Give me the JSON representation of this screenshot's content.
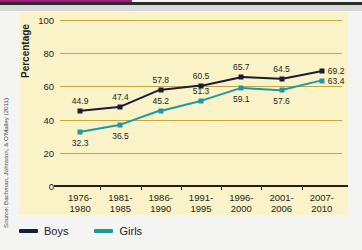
{
  "source_note": "Source: Bachman, Johnston, & O'Malley (2011)",
  "axis": {
    "ylabel": "Percentage"
  },
  "legend": {
    "items": [
      {
        "label": "Boys",
        "color": "#1b1b3a"
      },
      {
        "label": "Girls",
        "color": "#1a9aa6"
      }
    ]
  },
  "colors": {
    "panel_background": "#faf3c8",
    "gridline": "#c8a63c",
    "axis": "#231f20",
    "boys": "#1b1b3a",
    "girls": "#1a9aa6",
    "page": "#f4f4f2",
    "accent_magenta": "#a8197e"
  },
  "chart_data": {
    "type": "line",
    "title": "",
    "xlabel": "",
    "ylabel": "Percentage",
    "ylim": [
      0,
      100
    ],
    "yticks": [
      0,
      20,
      40,
      60,
      80,
      100
    ],
    "grid": true,
    "legend_position": "bottom-left",
    "categories": [
      "1976-\n1980",
      "1981-\n1985",
      "1986-\n1990",
      "1991-\n1995",
      "1996-\n2000",
      "2001-\n2006",
      "2007-\n2010"
    ],
    "series": [
      {
        "name": "Boys",
        "color": "#1b1b3a",
        "values": [
          44.9,
          47.4,
          57.8,
          60.5,
          65.7,
          64.5,
          69.2
        ],
        "labels": [
          "44.9",
          "47.4",
          "57.8",
          "60.5",
          "65.7",
          "64.5",
          "69.2"
        ]
      },
      {
        "name": "Girls",
        "color": "#1a9aa6",
        "values": [
          32.3,
          36.5,
          45.2,
          51.3,
          59.1,
          57.6,
          63.4
        ],
        "labels": [
          "32.3",
          "36.5",
          "45.2",
          "51.3",
          "59.1",
          "57.6",
          "63.4"
        ]
      }
    ]
  }
}
